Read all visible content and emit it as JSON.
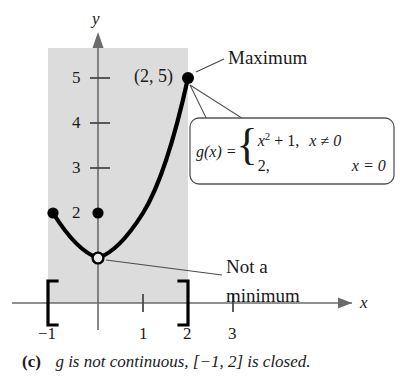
{
  "figure": {
    "type": "function-graph",
    "caption": {
      "label": "(c)",
      "text": "g is not continuous, [−1, 2] is closed."
    },
    "axes": {
      "x_axis_label": "x",
      "y_axis_label": "y",
      "x_ticks": [
        "−1",
        "1",
        "2",
        "3"
      ],
      "x_tick_values": [
        -1,
        1,
        2,
        3
      ],
      "y_ticks": [
        "2",
        "3",
        "4",
        "5"
      ],
      "y_tick_values": [
        2,
        3,
        4,
        5
      ],
      "xlim": [
        -1.7,
        3.9
      ],
      "ylim": [
        -0.55,
        5.9
      ],
      "origin_px": [
        98,
        303
      ],
      "unit_px": 45
    },
    "shaded_domain": {
      "from": -1,
      "to": 2,
      "color": "#dcdcdc"
    },
    "interval_brackets": {
      "left": "[",
      "right": "]",
      "left_value": -1,
      "right_value": 2
    },
    "curve": {
      "expression": "x^2 + 1",
      "color": "#000000",
      "from": -1,
      "to": 2
    },
    "points": [
      {
        "name": "left-endpoint",
        "x": -1,
        "y": 2,
        "style": "filled"
      },
      {
        "name": "value-at-zero",
        "x": 0,
        "y": 2,
        "style": "filled"
      },
      {
        "name": "removed-point",
        "x": 0,
        "y": 1,
        "style": "open"
      },
      {
        "name": "maximum-point",
        "x": 2,
        "y": 5,
        "style": "filled"
      }
    ],
    "annotations": {
      "maximum": "Maximum",
      "not_a_minimum_line1": "Not a",
      "not_a_minimum_line2": "minimum",
      "max_coordinate": "(2, 5)"
    },
    "callout": {
      "function_name": "g(x) =",
      "branches": [
        {
          "value": "x",
          "exponent": "2",
          "value_tail": " + 1,",
          "condition": "x ≠ 0"
        },
        {
          "value": "2,",
          "exponent": "",
          "value_tail": "",
          "condition": "x = 0"
        }
      ],
      "border_color": "#555555",
      "background": "#ffffff"
    }
  }
}
